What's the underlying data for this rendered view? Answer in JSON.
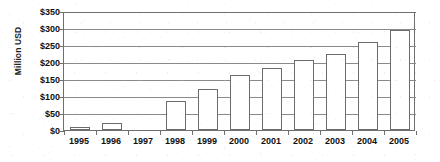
{
  "chart_data": {
    "type": "bar",
    "title": "",
    "xlabel": "",
    "ylabel": "Million USD",
    "categories": [
      "1995",
      "1996",
      "1997",
      "1998",
      "1999",
      "2000",
      "2001",
      "2002",
      "2003",
      "2004",
      "2005"
    ],
    "values": [
      8,
      22,
      0,
      85,
      122,
      163,
      182,
      207,
      224,
      258,
      295
    ],
    "ylim": [
      0,
      350
    ],
    "ytick_step": 50,
    "ytick_labels": [
      "$0",
      "$50",
      "$100",
      "$150",
      "$200",
      "$250",
      "$300",
      "$350"
    ],
    "ytick_values": [
      0,
      50,
      100,
      150,
      200,
      250,
      300,
      350
    ],
    "grid": true,
    "legend": false,
    "legend_position": "none",
    "value_prefix": "$",
    "bar_fill_color": "#ffffff",
    "bar_border_color": "#6b6b6b",
    "gridline_color": "#8a8a8a",
    "axis_color": "#6f6f6f",
    "text_color": "#101010",
    "background_color": "#ffffff"
  }
}
